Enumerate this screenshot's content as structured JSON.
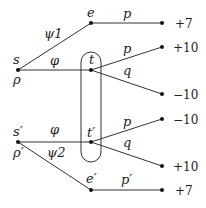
{
  "diagram": {
    "type": "game-tree",
    "nodes": {
      "s": {
        "label": "s",
        "sublabel": "ρ"
      },
      "e": {
        "label": "e"
      },
      "t": {
        "label": "t"
      },
      "s_prime": {
        "label": "s′",
        "sublabel": "ρ′"
      },
      "t_prime": {
        "label": "t′"
      },
      "e_prime": {
        "label": "e′"
      }
    },
    "edges": {
      "s_e": "ψ1",
      "s_t": "φ",
      "e_term": "p",
      "t_top": "p",
      "t_bot": "q",
      "sp_tp": "φ",
      "sp_ep": "ψ2",
      "tp_top": "p",
      "tp_bot": "q",
      "ep_term": "p′"
    },
    "payoffs": {
      "e": "+7",
      "t_p": "+10",
      "t_q": "−10",
      "tp_p": "−10",
      "tp_q": "+10",
      "ep": "+7"
    },
    "info_set": [
      "t",
      "t′"
    ]
  }
}
